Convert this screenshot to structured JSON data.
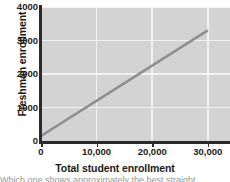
{
  "chart_data": {
    "type": "line",
    "title": "",
    "xlabel": "Total student enrollment",
    "ylabel": "Freshman enrollment",
    "xlim": [
      0,
      34000
    ],
    "ylim": [
      0,
      4000
    ],
    "xticks": [
      0,
      10000,
      20000,
      30000
    ],
    "xticklabels": [
      "0",
      "10,000",
      "20,000",
      "30,000"
    ],
    "yticks": [
      0,
      1000,
      2000,
      3000,
      4000
    ],
    "yticklabels": [
      "0",
      "1000",
      "2000",
      "3000",
      "4000"
    ],
    "grid": true,
    "legend": "none",
    "series": [
      {
        "name": "best-fit line",
        "x": [
          0,
          30000
        ],
        "values": [
          150,
          3300
        ],
        "color": "#8f8f8f"
      }
    ],
    "plot_background": "#d3d3d3",
    "gridline_color": "#f2f2f2",
    "axis_color": "#2b2b2b"
  },
  "caption": {
    "text": "Which one shows approximately the best straight"
  }
}
